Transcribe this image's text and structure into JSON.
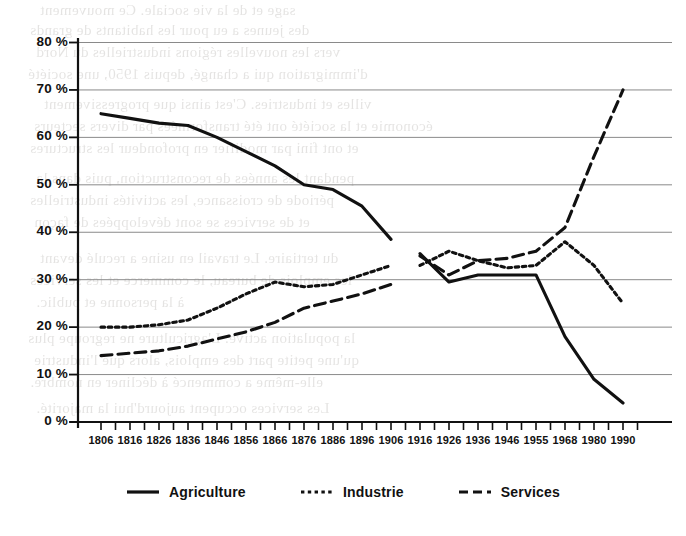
{
  "chart_data": {
    "type": "line",
    "title": "",
    "subtitle": "",
    "xlabel": "",
    "ylabel": "",
    "ylim": [
      0,
      85
    ],
    "grid": true,
    "grid_axis": "y",
    "legend_position": "bottom-center",
    "x_tick_labels": [
      "1806",
      "1816",
      "1826",
      "1836",
      "1846",
      "1856",
      "1866",
      "1876",
      "1886",
      "1896",
      "1906",
      "1916",
      "1926",
      "1936",
      "1946",
      "1955",
      "1968",
      "1980",
      "1990"
    ],
    "y_tick_labels": [
      "80 %",
      "70 %",
      "60 %",
      "50 %",
      "40 %",
      "30 %",
      "20 %",
      "10 %",
      "0 %"
    ],
    "y_tick_values": [
      80,
      70,
      60,
      50,
      40,
      30,
      20,
      10,
      0
    ],
    "minor_ticks_between_labels": 1,
    "series": [
      {
        "name": "Agriculture",
        "style": "solid",
        "color": "#111111",
        "segments": [
          {
            "x": [
              "1806",
              "1816",
              "1826",
              "1836",
              "1846",
              "1856",
              "1866",
              "1876",
              "1886",
              "1896",
              "1906"
            ],
            "values": [
              65,
              64,
              63,
              62.5,
              60,
              57,
              54,
              50,
              49,
              45.5,
              38.5
            ]
          },
          {
            "x": [
              "1916",
              "1926",
              "1936",
              "1946",
              "1955",
              "1968",
              "1980",
              "1990"
            ],
            "values": [
              35.5,
              29.5,
              31,
              31,
              31,
              18,
              9,
              4
            ]
          }
        ]
      },
      {
        "name": "Industrie",
        "style": "dotted",
        "color": "#111111",
        "segments": [
          {
            "x": [
              "1806",
              "1816",
              "1826",
              "1836",
              "1846",
              "1856",
              "1866",
              "1876",
              "1886",
              "1896",
              "1906"
            ],
            "values": [
              20,
              20,
              20.5,
              21.5,
              24,
              27,
              29.5,
              28.5,
              29,
              31,
              33
            ]
          },
          {
            "x": [
              "1916",
              "1926",
              "1936",
              "1946",
              "1955",
              "1968",
              "1980",
              "1990"
            ],
            "values": [
              33,
              36,
              34,
              32.5,
              33,
              38,
              33,
              25
            ]
          }
        ]
      },
      {
        "name": "Services",
        "style": "dashed",
        "color": "#111111",
        "segments": [
          {
            "x": [
              "1806",
              "1816",
              "1826",
              "1836",
              "1846",
              "1856",
              "1866",
              "1876",
              "1886",
              "1896",
              "1906"
            ],
            "values": [
              14,
              14.5,
              15,
              16,
              17.5,
              19,
              21,
              24,
              25.5,
              27,
              29
            ]
          },
          {
            "x": [
              "1916",
              "1926",
              "1936",
              "1946",
              "1955",
              "1968",
              "1980",
              "1990"
            ],
            "values": [
              35,
              31,
              34,
              34.5,
              36,
              41,
              56,
              70
            ]
          }
        ]
      }
    ]
  },
  "legend": {
    "items": [
      {
        "label": "Agriculture",
        "style": "solid"
      },
      {
        "label": "Industrie",
        "style": "dotted"
      },
      {
        "label": "Services",
        "style": "dashed"
      }
    ]
  },
  "ghost_text": {
    "lines": [
      "sage et de la vie sociale. Ce mouvement",
      "des jeunes a eu pour les habitants de grands",
      "vers les nouvelles régions industrielles du Nord",
      "d'immigration qui a changé, depuis 1950, une société",
      "villes et industries. C'est ainsi que progressivement",
      "économie et la société ont été transformées par divers secteurs",
      "et ont fini par modifier en profondeur les structures",
      "pendant les années de reconstruction, puis dans la",
      "période de croissance, les activités industrielles",
      "et de services se sont développées de façon",
      "du tertiaire. Le travail en usine a reculé devant",
      "les emplois de bureau, le commerce et les services",
      "à la personne et public.",
      "la population active. L'agriculture ne regroupe plus",
      "qu'une petite part des emplois, alors que l'industrie",
      "elle-même a commencé à décliner en nombre.",
      "Les services occupent aujourd'hui la majorité."
    ]
  }
}
